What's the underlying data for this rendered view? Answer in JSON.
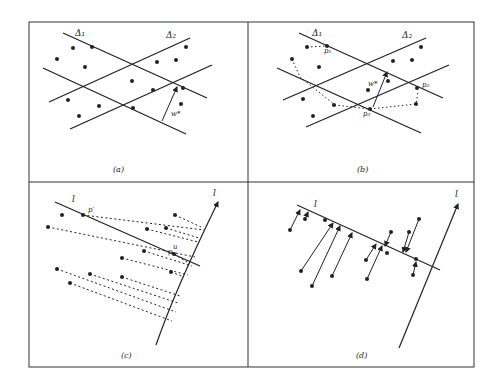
{
  "figure": {
    "panels": [
      {
        "id": "a",
        "caption": "(a)",
        "labels": {
          "delta1": "Δ₁",
          "delta2": "Δ₂",
          "width": "w*"
        }
      },
      {
        "id": "b",
        "caption": "(b)",
        "labels": {
          "delta1": "Δ₁",
          "delta2": "Δ₂",
          "width": "w*",
          "p1": "p₁",
          "p2": "p₂",
          "p3": "p₃"
        }
      },
      {
        "id": "c",
        "caption": "(c)",
        "labels": {
          "line": "l",
          "axis": "l",
          "p_prime": "p′",
          "p": "p",
          "u": "u"
        }
      },
      {
        "id": "d",
        "caption": "(d)",
        "labels": {
          "line": "l",
          "axis": "l"
        }
      }
    ],
    "colors": {
      "ink": "#222222",
      "background": "#ffffff",
      "frame": "#333333"
    }
  }
}
